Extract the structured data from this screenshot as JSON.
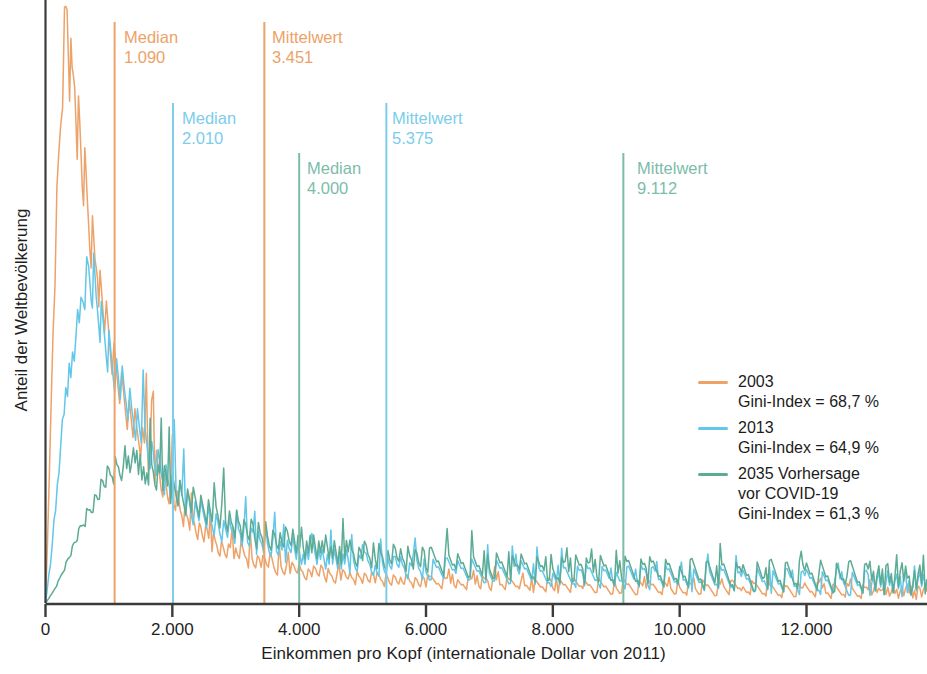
{
  "chart_data": {
    "type": "line",
    "title": "",
    "xlabel": "Einkommen pro Kopf (internationale Dollar von 2011)",
    "ylabel": "Anteil der Weltbevölkerung",
    "xlim": [
      0,
      13900
    ],
    "ylim": [
      0,
      1.0
    ],
    "grid": false,
    "legend_position": "right-middle",
    "xticks": [
      0,
      2000,
      4000,
      6000,
      8000,
      10000,
      12000
    ],
    "xtick_labels": [
      "0",
      "2.000",
      "4.000",
      "6.000",
      "8.000",
      "10.000",
      "12.000"
    ],
    "yticks": [],
    "ytick_labels": [],
    "colors": {
      "series_2003": "#eda268",
      "series_2013": "#62c7e8",
      "series_2035": "#5cab95",
      "axis": "#3b3b3b",
      "text": "#1e1e1e",
      "marker_orange": "#eda268",
      "marker_blue": "#7ccdea",
      "marker_green": "#7cbcab"
    },
    "series": [
      {
        "name": "2003",
        "label_line1": "2003",
        "label_line2": "Gini-Index = 68,7 %",
        "color": "#eda268",
        "gini": "68,7 %",
        "median": 1090,
        "mean": 3451,
        "peak_x": 350,
        "peak_y": 1.0,
        "points": [
          [
            0,
            0.0
          ],
          [
            60,
            0.2
          ],
          [
            120,
            0.46
          ],
          [
            180,
            0.66
          ],
          [
            240,
            0.82
          ],
          [
            300,
            0.95
          ],
          [
            340,
            1.0
          ],
          [
            380,
            0.9
          ],
          [
            420,
            0.86
          ],
          [
            460,
            0.88
          ],
          [
            500,
            0.81
          ],
          [
            540,
            0.78
          ],
          [
            580,
            0.72
          ],
          [
            620,
            0.7
          ],
          [
            660,
            0.66
          ],
          [
            700,
            0.62
          ],
          [
            740,
            0.6
          ],
          [
            780,
            0.57
          ],
          [
            820,
            0.58
          ],
          [
            860,
            0.52
          ],
          [
            900,
            0.5
          ],
          [
            960,
            0.46
          ],
          [
            1020,
            0.43
          ],
          [
            1080,
            0.4
          ],
          [
            1140,
            0.38
          ],
          [
            1200,
            0.36
          ],
          [
            1260,
            0.34
          ],
          [
            1320,
            0.32
          ],
          [
            1380,
            0.3
          ],
          [
            1440,
            0.28
          ],
          [
            1500,
            0.27
          ],
          [
            1560,
            0.26
          ],
          [
            1620,
            0.25
          ],
          [
            1700,
            0.235
          ],
          [
            1800,
            0.215
          ],
          [
            1900,
            0.195
          ],
          [
            2000,
            0.175
          ],
          [
            2100,
            0.158
          ],
          [
            2200,
            0.145
          ],
          [
            2300,
            0.133
          ],
          [
            2400,
            0.122
          ],
          [
            2500,
            0.113
          ],
          [
            2600,
            0.105
          ],
          [
            2700,
            0.098
          ],
          [
            2800,
            0.092
          ],
          [
            3000,
            0.082
          ],
          [
            3200,
            0.074
          ],
          [
            3400,
            0.068
          ],
          [
            3600,
            0.062
          ],
          [
            3800,
            0.058
          ],
          [
            4000,
            0.054
          ],
          [
            4400,
            0.048
          ],
          [
            4800,
            0.044
          ],
          [
            5200,
            0.041
          ],
          [
            5600,
            0.039
          ],
          [
            6000,
            0.037
          ],
          [
            6500,
            0.035
          ],
          [
            7000,
            0.033
          ],
          [
            7500,
            0.031
          ],
          [
            8000,
            0.03
          ],
          [
            8500,
            0.029
          ],
          [
            9000,
            0.028
          ],
          [
            9500,
            0.027
          ],
          [
            10000,
            0.026
          ],
          [
            11000,
            0.024
          ],
          [
            12000,
            0.022
          ],
          [
            13000,
            0.02
          ],
          [
            13900,
            0.019
          ]
        ]
      },
      {
        "name": "2013",
        "label_line1": "2013",
        "label_line2": "Gini-Index = 64,9 %",
        "color": "#62c7e8",
        "gini": "64,9 %",
        "median": 2010,
        "mean": 5375,
        "peak_x": 700,
        "peak_y": 0.545,
        "points": [
          [
            0,
            0.0
          ],
          [
            80,
            0.07
          ],
          [
            160,
            0.16
          ],
          [
            240,
            0.26
          ],
          [
            320,
            0.34
          ],
          [
            400,
            0.4
          ],
          [
            480,
            0.45
          ],
          [
            560,
            0.49
          ],
          [
            620,
            0.52
          ],
          [
            680,
            0.545
          ],
          [
            720,
            0.525
          ],
          [
            760,
            0.535
          ],
          [
            800,
            0.5
          ],
          [
            840,
            0.49
          ],
          [
            880,
            0.465
          ],
          [
            920,
            0.455
          ],
          [
            960,
            0.44
          ],
          [
            1000,
            0.425
          ],
          [
            1060,
            0.405
          ],
          [
            1120,
            0.385
          ],
          [
            1180,
            0.365
          ],
          [
            1240,
            0.345
          ],
          [
            1300,
            0.335
          ],
          [
            1360,
            0.315
          ],
          [
            1420,
            0.305
          ],
          [
            1480,
            0.29
          ],
          [
            1540,
            0.275
          ],
          [
            1600,
            0.265
          ],
          [
            1700,
            0.245
          ],
          [
            1800,
            0.225
          ],
          [
            1900,
            0.21
          ],
          [
            2000,
            0.195
          ],
          [
            2150,
            0.175
          ],
          [
            2300,
            0.16
          ],
          [
            2450,
            0.148
          ],
          [
            2600,
            0.137
          ],
          [
            2750,
            0.128
          ],
          [
            2900,
            0.12
          ],
          [
            3100,
            0.111
          ],
          [
            3300,
            0.103
          ],
          [
            3500,
            0.096
          ],
          [
            3700,
            0.09
          ],
          [
            3900,
            0.085
          ],
          [
            4200,
            0.079
          ],
          [
            4500,
            0.074
          ],
          [
            4800,
            0.069
          ],
          [
            5200,
            0.065
          ],
          [
            5600,
            0.061
          ],
          [
            6000,
            0.058
          ],
          [
            6500,
            0.055
          ],
          [
            7000,
            0.052
          ],
          [
            7500,
            0.05
          ],
          [
            8000,
            0.048
          ],
          [
            8500,
            0.046
          ],
          [
            9000,
            0.045
          ],
          [
            9500,
            0.043
          ],
          [
            10000,
            0.042
          ],
          [
            11000,
            0.039
          ],
          [
            12000,
            0.036
          ],
          [
            13000,
            0.033
          ],
          [
            13900,
            0.031
          ]
        ]
      },
      {
        "name": "2035 Vorhersage vor COVID-19",
        "label_line1": "2035 Vorhersage",
        "label_line2": "vor COVID-19",
        "label_line3": "Gini-Index = 61,3 %",
        "color": "#5cab95",
        "gini": "61,3 %",
        "median": 4000,
        "mean": 9112,
        "peak_x": 1250,
        "peak_y": 0.238,
        "points": [
          [
            0,
            0.0
          ],
          [
            100,
            0.015
          ],
          [
            200,
            0.035
          ],
          [
            300,
            0.06
          ],
          [
            400,
            0.085
          ],
          [
            500,
            0.11
          ],
          [
            600,
            0.135
          ],
          [
            700,
            0.158
          ],
          [
            800,
            0.178
          ],
          [
            900,
            0.198
          ],
          [
            1000,
            0.212
          ],
          [
            1100,
            0.225
          ],
          [
            1200,
            0.234
          ],
          [
            1280,
            0.238
          ],
          [
            1360,
            0.232
          ],
          [
            1440,
            0.233
          ],
          [
            1520,
            0.228
          ],
          [
            1600,
            0.222
          ],
          [
            1700,
            0.216
          ],
          [
            1800,
            0.208
          ],
          [
            1900,
            0.2
          ],
          [
            2000,
            0.192
          ],
          [
            2150,
            0.18
          ],
          [
            2300,
            0.169
          ],
          [
            2450,
            0.159
          ],
          [
            2600,
            0.15
          ],
          [
            2750,
            0.142
          ],
          [
            2900,
            0.134
          ],
          [
            3100,
            0.126
          ],
          [
            3300,
            0.118
          ],
          [
            3500,
            0.111
          ],
          [
            3700,
            0.105
          ],
          [
            3900,
            0.1
          ],
          [
            4200,
            0.094
          ],
          [
            4500,
            0.088
          ],
          [
            4800,
            0.083
          ],
          [
            5200,
            0.078
          ],
          [
            5600,
            0.074
          ],
          [
            6000,
            0.07
          ],
          [
            6500,
            0.066
          ],
          [
            7000,
            0.063
          ],
          [
            7500,
            0.06
          ],
          [
            8000,
            0.058
          ],
          [
            8500,
            0.056
          ],
          [
            9000,
            0.054
          ],
          [
            9500,
            0.052
          ],
          [
            10000,
            0.051
          ],
          [
            11000,
            0.048
          ],
          [
            12000,
            0.045
          ],
          [
            13000,
            0.042
          ],
          [
            13900,
            0.04
          ]
        ]
      }
    ],
    "markers": [
      {
        "id": "median-2003",
        "kind": "Median",
        "series": "2003",
        "label": "Median",
        "value_label": "1.090",
        "value": 1090,
        "color": "#eda268",
        "top": 22,
        "bottom": 603,
        "text_x": 124,
        "text_y": 27
      },
      {
        "id": "mean-2003",
        "kind": "Mittelwert",
        "series": "2003",
        "label": "Mittelwert",
        "value_label": "3.451",
        "value": 3451,
        "color": "#eda268",
        "top": 22,
        "bottom": 603,
        "text_x": 272,
        "text_y": 27
      },
      {
        "id": "median-2013",
        "kind": "Median",
        "series": "2013",
        "label": "Median",
        "value_label": "2.010",
        "value": 2010,
        "color": "#7ccdea",
        "top": 103,
        "bottom": 603,
        "text_x": 182,
        "text_y": 108
      },
      {
        "id": "mean-2013",
        "kind": "Mittelwert",
        "series": "2013",
        "label": "Mittelwert",
        "value_label": "5.375",
        "value": 5375,
        "color": "#7ccdea",
        "top": 103,
        "bottom": 603,
        "text_x": 392,
        "text_y": 108
      },
      {
        "id": "median-2035",
        "kind": "Median",
        "series": "2035",
        "label": "Median",
        "value_label": "4.000",
        "value": 4000,
        "color": "#7cbcab",
        "top": 153,
        "bottom": 603,
        "text_x": 307,
        "text_y": 158
      },
      {
        "id": "mean-2035",
        "kind": "Mittelwert",
        "series": "2035",
        "label": "Mittelwert",
        "value_label": "9.112",
        "value": 9112,
        "color": "#7cbcab",
        "top": 153,
        "bottom": 603,
        "text_x": 637,
        "text_y": 158
      }
    ]
  }
}
